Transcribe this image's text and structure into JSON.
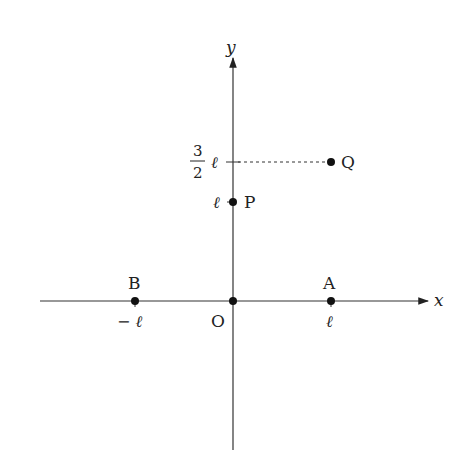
{
  "diagram": {
    "type": "coordinate-plane",
    "axes": {
      "x_label": "x",
      "y_label": "y",
      "origin_label": "O"
    },
    "points": [
      {
        "id": "O",
        "label": "O",
        "coords": "(0, 0)"
      },
      {
        "id": "A",
        "label": "A",
        "coords": "(ℓ, 0)"
      },
      {
        "id": "B",
        "label": "B",
        "coords": "(−ℓ, 0)"
      },
      {
        "id": "P",
        "label": "P",
        "coords": "(0, ℓ)"
      },
      {
        "id": "Q",
        "label": "Q",
        "coords": "(ℓ, 3ℓ/2)"
      }
    ],
    "tick_labels": {
      "x_pos": "ℓ",
      "x_neg": "− ℓ",
      "y_p": "ℓ",
      "y_q_num": "3",
      "y_q_den": "2",
      "y_q_unit": "ℓ"
    },
    "colors": {
      "line": "#333333",
      "point": "#111111",
      "text": "#222222",
      "background": "#ffffff"
    }
  }
}
